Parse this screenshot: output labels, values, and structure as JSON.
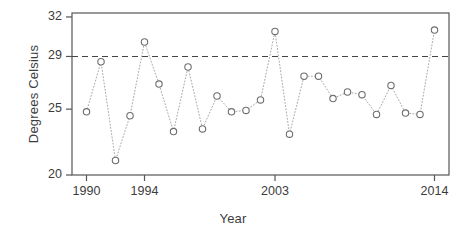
{
  "chart_data": {
    "type": "scatter",
    "title": "",
    "xlabel": "Year",
    "ylabel": "Degrees Celsius",
    "xlim": [
      1989.0,
      2015.0
    ],
    "ylim": [
      20.0,
      32.3
    ],
    "grid": false,
    "legend": null,
    "marker": "open-circle",
    "line_style": "dotted",
    "point_color": "#6e6e6e",
    "line_color": "#a8a8a8",
    "axis_color": "#555555",
    "text_color": "#3c3c3c",
    "x": [
      1990,
      1991,
      1992,
      1993,
      1994,
      1995,
      1996,
      1997,
      1998,
      1999,
      2000,
      2001,
      2002,
      2003,
      2004,
      2005,
      2006,
      2007,
      2008,
      2009,
      2010,
      2011,
      2012,
      2013,
      2014
    ],
    "values": [
      24.8,
      28.6,
      21.1,
      24.5,
      30.1,
      26.9,
      23.3,
      28.2,
      23.5,
      26.0,
      24.8,
      24.9,
      25.7,
      30.9,
      23.1,
      27.5,
      27.5,
      25.8,
      26.3,
      26.1,
      24.6,
      26.8,
      24.7,
      24.6,
      31.0
    ],
    "xticks": [
      1990,
      1994,
      2003,
      2014
    ],
    "xtick_labels": [
      "1990",
      "1994",
      "2003",
      "2014"
    ],
    "yticks": [
      20,
      25,
      29,
      32
    ],
    "ytick_labels": [
      "20",
      "25",
      "29",
      "32"
    ],
    "annotations": [
      {
        "type": "hline",
        "name": "reference-line",
        "y": 29,
        "style": "dashed",
        "color": "#444444",
        "label": "29"
      }
    ]
  },
  "axis_titles": {
    "x": "Year",
    "y": "Degrees Celsius"
  }
}
